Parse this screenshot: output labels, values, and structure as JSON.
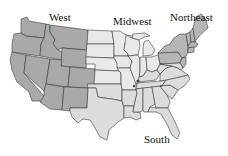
{
  "map": {
    "title": "United States Census Regions",
    "regions": [
      {
        "id": "west",
        "label": "West",
        "color": "#a9a9a9"
      },
      {
        "id": "midwest",
        "label": "Midwest",
        "color": "#e9e9e9"
      },
      {
        "id": "northeast",
        "label": "Northeast",
        "color": "#b6b6b6"
      },
      {
        "id": "south",
        "label": "South",
        "color": "#dcdcdc"
      }
    ],
    "border_color": "#3a3a3a",
    "background": "#ffffff"
  }
}
